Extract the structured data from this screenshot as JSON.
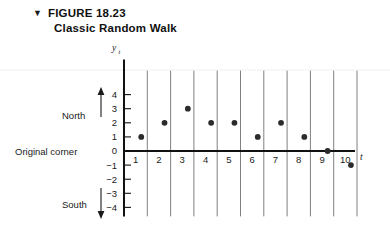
{
  "figure": {
    "marker_glyph": "▼",
    "number_label": "FIGURE 18.23",
    "subtitle": "Classic Random Walk"
  },
  "annotations": {
    "north_label": "North",
    "south_label": "South",
    "origin_label": "Original corner"
  },
  "colors": {
    "ink": "#1a1a1a",
    "axis": "#111111",
    "gridline": "#808080",
    "marker": "#2b2b2b",
    "faint_rule": "#f0eef0"
  },
  "chart_data": {
    "type": "scatter",
    "title": "Classic Random Walk",
    "xlabel": "t",
    "ylabel": "y_t",
    "x": [
      1,
      2,
      3,
      4,
      5,
      6,
      7,
      8,
      9,
      10
    ],
    "values": [
      1,
      2,
      3,
      2,
      2,
      1,
      2,
      1,
      0,
      -1
    ],
    "xlim": [
      0,
      11
    ],
    "ylim": [
      -4,
      4
    ],
    "xticks": [
      1,
      2,
      3,
      4,
      5,
      6,
      7,
      8,
      9,
      10
    ],
    "xtick_labels": [
      "1",
      "2",
      "3",
      "4",
      "5",
      "6",
      "7",
      "8",
      "9",
      "10"
    ],
    "yticks": [
      4,
      3,
      2,
      1,
      0,
      -1,
      -2,
      -3,
      -4
    ],
    "ytick_labels": [
      "4",
      "3",
      "2",
      "1",
      "0",
      "−1",
      "−2",
      "−3",
      "−4"
    ],
    "grid": "vertical",
    "legend": "none"
  }
}
